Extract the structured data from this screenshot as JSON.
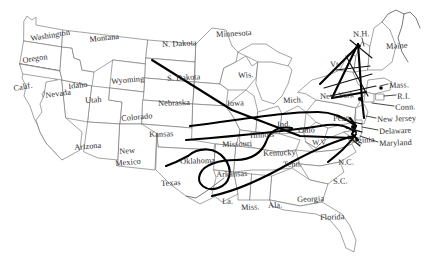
{
  "map": {
    "title": "United States route map",
    "background_color": "#ffffff",
    "border_color": "#7d7d7d",
    "route_color": "#000000",
    "label_color": "#2b2b2b",
    "labels": [
      {
        "name": "washington",
        "text": "Washington",
        "x": 30,
        "y": 35,
        "size": 8.2,
        "rot": -9
      },
      {
        "name": "oregon",
        "text": "Oregon",
        "x": 22,
        "y": 57,
        "size": 8.2,
        "rot": -9
      },
      {
        "name": "montana",
        "text": "Montana",
        "x": 89,
        "y": 36,
        "size": 8.2,
        "rot": -6
      },
      {
        "name": "idaho",
        "text": "Idaho",
        "x": 68,
        "y": 83,
        "size": 8.2,
        "rot": -7
      },
      {
        "name": "wyoming",
        "text": "Wyoming",
        "x": 111,
        "y": 78,
        "size": 8.2,
        "rot": -5
      },
      {
        "name": "california",
        "text": "Calif.",
        "x": 13,
        "y": 85,
        "size": 8.2,
        "rot": -10
      },
      {
        "name": "nevada",
        "text": "Nevada",
        "x": 45,
        "y": 92,
        "size": 8.2,
        "rot": -8
      },
      {
        "name": "utah",
        "text": "Utah",
        "x": 85,
        "y": 97,
        "size": 8.2,
        "rot": -3
      },
      {
        "name": "colorado",
        "text": "Colorado",
        "x": 121,
        "y": 115,
        "size": 8.2,
        "rot": -5
      },
      {
        "name": "arizona",
        "text": "Arizona",
        "x": 74,
        "y": 144,
        "size": 8.2,
        "rot": -5
      },
      {
        "name": "new-mexico-1",
        "text": "New",
        "x": 119,
        "y": 148,
        "size": 8.2,
        "rot": -5
      },
      {
        "name": "new-mexico-2",
        "text": "Mexico",
        "x": 115,
        "y": 160,
        "size": 8.2,
        "rot": -5
      },
      {
        "name": "north-dakota",
        "text": "N. Dakota",
        "x": 162,
        "y": 41,
        "size": 8.2,
        "rot": -3
      },
      {
        "name": "south-dakota",
        "text": "S. Dakota",
        "x": 167,
        "y": 75,
        "size": 8.2,
        "rot": -3
      },
      {
        "name": "nebraska",
        "text": "Nebraska",
        "x": 158,
        "y": 100,
        "size": 8.2,
        "rot": -2
      },
      {
        "name": "kansas",
        "text": "Kansas",
        "x": 149,
        "y": 131,
        "size": 8.2,
        "rot": -2
      },
      {
        "name": "oklahoma",
        "text": "Oklahoma",
        "x": 180,
        "y": 158,
        "size": 8.2,
        "rot": -2
      },
      {
        "name": "texas",
        "text": "Texas",
        "x": 161,
        "y": 180,
        "size": 8.2,
        "rot": -3
      },
      {
        "name": "minnesota",
        "text": "Minnesota",
        "x": 216,
        "y": 31,
        "size": 8.2,
        "rot": -3
      },
      {
        "name": "wisconsin",
        "text": "Wis.",
        "x": 238,
        "y": 72,
        "size": 8.2,
        "rot": -3
      },
      {
        "name": "iowa",
        "text": "Iowa",
        "x": 227,
        "y": 100,
        "size": 8.2,
        "rot": -2
      },
      {
        "name": "missouri",
        "text": "Missouri",
        "x": 222,
        "y": 141,
        "size": 8.2,
        "rot": -2
      },
      {
        "name": "arkansas",
        "text": "Arkansas",
        "x": 216,
        "y": 171,
        "size": 8.2,
        "rot": -2
      },
      {
        "name": "louisiana",
        "text": "La.",
        "x": 222,
        "y": 198,
        "size": 8.2,
        "rot": -2
      },
      {
        "name": "mississippi",
        "text": "Miss.",
        "x": 241,
        "y": 204,
        "size": 8.2,
        "rot": -2
      },
      {
        "name": "alabama",
        "text": "Ala.",
        "x": 268,
        "y": 202,
        "size": 8.2,
        "rot": -2
      },
      {
        "name": "illinois",
        "text": "Illinois",
        "x": 250,
        "y": 132,
        "size": 8.2,
        "rot": -3
      },
      {
        "name": "indiana",
        "text": "Ind.",
        "x": 277,
        "y": 121,
        "size": 8.2,
        "rot": -2
      },
      {
        "name": "ohio",
        "text": "Ohio",
        "x": 298,
        "y": 127,
        "size": 8.2,
        "rot": -2
      },
      {
        "name": "michigan",
        "text": "Mich.",
        "x": 283,
        "y": 97,
        "size": 8.2,
        "rot": -2
      },
      {
        "name": "kentucky",
        "text": "Kentucky",
        "x": 263,
        "y": 150,
        "size": 8.2,
        "rot": -2
      },
      {
        "name": "tennessee",
        "text": "Tenn.",
        "x": 283,
        "y": 161,
        "size": 8.2,
        "rot": -2
      },
      {
        "name": "west-virginia",
        "text": "W.V.",
        "x": 312,
        "y": 139,
        "size": 7.6,
        "rot": -2
      },
      {
        "name": "georgia",
        "text": "Georgia",
        "x": 297,
        "y": 196,
        "size": 8.2,
        "rot": -2
      },
      {
        "name": "florida",
        "text": "Florida",
        "x": 320,
        "y": 214,
        "size": 8.2,
        "rot": -2
      },
      {
        "name": "south-carolina",
        "text": "S.C.",
        "x": 333,
        "y": 178,
        "size": 8.2,
        "rot": -2
      },
      {
        "name": "north-carolina",
        "text": "N.C.",
        "x": 338,
        "y": 159,
        "size": 8.2,
        "rot": -2
      },
      {
        "name": "virginia",
        "text": "Virginia",
        "x": 347,
        "y": 137,
        "size": 8.2,
        "rot": -2
      },
      {
        "name": "pennsylvania",
        "text": "Penn.",
        "x": 333,
        "y": 115,
        "size": 8.2,
        "rot": -2
      },
      {
        "name": "new-york",
        "text": "New York",
        "x": 320,
        "y": 93,
        "size": 8.2,
        "rot": -3
      },
      {
        "name": "vermont",
        "text": "Vt.",
        "x": 330,
        "y": 61,
        "size": 8.2,
        "rot": -3
      },
      {
        "name": "new-hampshire",
        "text": "N.H.",
        "x": 353,
        "y": 31,
        "size": 8.2,
        "rot": -3
      },
      {
        "name": "maine",
        "text": "Maine",
        "x": 386,
        "y": 43,
        "size": 8.2,
        "rot": -3
      },
      {
        "name": "massachusetts",
        "text": "Mass.",
        "x": 389,
        "y": 82,
        "size": 8.2,
        "rot": -2
      },
      {
        "name": "rhode-island",
        "text": "R.I.",
        "x": 397,
        "y": 93,
        "size": 8.2,
        "rot": -2
      },
      {
        "name": "connecticut",
        "text": "Conn.",
        "x": 395,
        "y": 104,
        "size": 8.2,
        "rot": -2
      },
      {
        "name": "new-jersey",
        "text": "New Jersey",
        "x": 377,
        "y": 116,
        "size": 8.2,
        "rot": -2
      },
      {
        "name": "delaware",
        "text": "Delaware",
        "x": 379,
        "y": 128,
        "size": 8.2,
        "rot": -2
      },
      {
        "name": "maryland",
        "text": "Maryland",
        "x": 379,
        "y": 140,
        "size": 8.2,
        "rot": -2
      }
    ]
  }
}
